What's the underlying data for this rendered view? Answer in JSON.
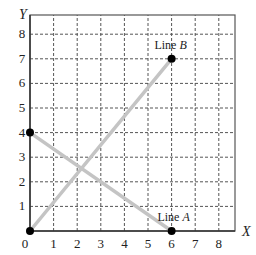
{
  "chart_data": {
    "type": "line",
    "title": "",
    "xlabel": "X",
    "ylabel": "Y",
    "xlim": [
      0,
      8.5
    ],
    "ylim": [
      0,
      8.5
    ],
    "grid": true,
    "x_ticks": [
      "0",
      "1",
      "2",
      "3",
      "4",
      "5",
      "6",
      "7",
      "8"
    ],
    "y_ticks": [
      "1",
      "2",
      "3",
      "4",
      "5",
      "6",
      "7",
      "8"
    ],
    "series": [
      {
        "name": "Line A",
        "label_prefix": "Line ",
        "label_italic": "A",
        "points": [
          [
            0,
            4
          ],
          [
            6,
            0
          ]
        ],
        "markers": [
          [
            0,
            4
          ],
          [
            6,
            0
          ]
        ]
      },
      {
        "name": "Line B",
        "label_prefix": "Line ",
        "label_italic": "B",
        "points": [
          [
            0,
            0
          ],
          [
            6,
            7
          ]
        ],
        "markers": [
          [
            0,
            0
          ],
          [
            6,
            7
          ]
        ]
      }
    ]
  },
  "colors": {
    "line": "#c4c4c4",
    "grid": "#555555",
    "axis": "#555555",
    "marker": "#000000"
  }
}
